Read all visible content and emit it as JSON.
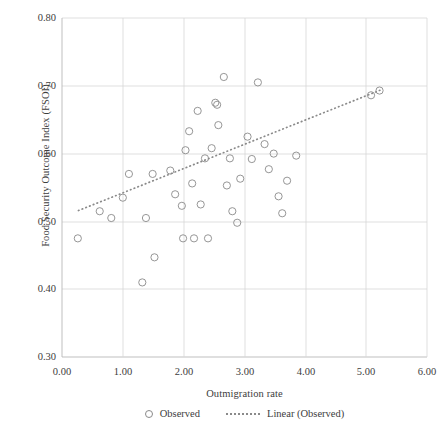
{
  "chart_data": {
    "type": "scatter",
    "title": "",
    "xlabel": "Outmigration rate",
    "ylabel": "Food Security Outcome Index (FSOI)",
    "xlim": [
      0.0,
      6.0
    ],
    "ylim": [
      0.3,
      0.8
    ],
    "xticks": [
      "0.00",
      "1.00",
      "2.00",
      "3.00",
      "4.00",
      "5.00",
      "6.00"
    ],
    "xtick_values": [
      0.0,
      1.0,
      2.0,
      3.0,
      4.0,
      5.0,
      6.0
    ],
    "yticks": [
      "0.30",
      "0.40",
      "0.50",
      "0.60",
      "0.70",
      "0.80"
    ],
    "ytick_values": [
      0.3,
      0.4,
      0.5,
      0.6,
      0.7,
      0.8
    ],
    "grid": true,
    "legend_position": "bottom",
    "series": [
      {
        "name": "Observed",
        "type": "scatter",
        "marker": "open-circle",
        "color": "#8a8a8a",
        "points": [
          [
            0.26,
            0.475
          ],
          [
            0.62,
            0.515
          ],
          [
            0.81,
            0.505
          ],
          [
            1.0,
            0.535
          ],
          [
            1.1,
            0.57
          ],
          [
            1.32,
            0.41
          ],
          [
            1.38,
            0.505
          ],
          [
            1.49,
            0.57
          ],
          [
            1.52,
            0.447
          ],
          [
            1.78,
            0.575
          ],
          [
            1.86,
            0.54
          ],
          [
            1.97,
            0.523
          ],
          [
            1.99,
            0.475
          ],
          [
            2.03,
            0.605
          ],
          [
            2.09,
            0.633
          ],
          [
            2.14,
            0.556
          ],
          [
            2.17,
            0.475
          ],
          [
            2.23,
            0.663
          ],
          [
            2.28,
            0.525
          ],
          [
            2.35,
            0.593
          ],
          [
            2.4,
            0.475
          ],
          [
            2.46,
            0.608
          ],
          [
            2.52,
            0.675
          ],
          [
            2.55,
            0.672
          ],
          [
            2.57,
            0.642
          ],
          [
            2.66,
            0.713
          ],
          [
            2.71,
            0.553
          ],
          [
            2.76,
            0.593
          ],
          [
            2.8,
            0.515
          ],
          [
            2.88,
            0.498
          ],
          [
            2.93,
            0.563
          ],
          [
            3.05,
            0.625
          ],
          [
            3.12,
            0.592
          ],
          [
            3.22,
            0.705
          ],
          [
            3.33,
            0.614
          ],
          [
            3.4,
            0.577
          ],
          [
            3.48,
            0.6
          ],
          [
            3.56,
            0.537
          ],
          [
            3.62,
            0.512
          ],
          [
            3.7,
            0.56
          ],
          [
            3.85,
            0.597
          ],
          [
            5.08,
            0.686
          ],
          [
            5.22,
            0.693
          ]
        ]
      },
      {
        "name": "Linear (Observed)",
        "type": "line",
        "style": "dotted",
        "color": "#8a8a8a",
        "endpoints": [
          [
            0.27,
            0.516
          ],
          [
            5.27,
            0.695
          ]
        ],
        "slope": 0.0358,
        "intercept": 0.5063
      }
    ]
  },
  "legend": {
    "items": [
      {
        "label": "Observed",
        "marker": "open-circle-marker"
      },
      {
        "label": "Linear (Observed)",
        "marker": "dotted-line-marker"
      }
    ]
  }
}
